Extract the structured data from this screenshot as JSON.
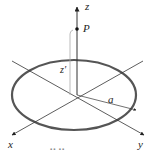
{
  "figure": {
    "colors": {
      "background": "#ffffff",
      "ring": "#555555",
      "axes": "#333333",
      "guide": "#aaaaaa"
    }
  },
  "labels": {
    "z_axis": "z",
    "x_axis": "x",
    "y_axis": "y",
    "point": "P",
    "height": "z′",
    "radius": "a",
    "caption_partial": "▪▪ ▪▪"
  }
}
